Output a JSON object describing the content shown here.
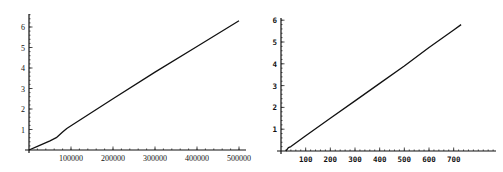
{
  "chart_data": [
    {
      "type": "line",
      "title": "",
      "xlabel": "",
      "ylabel": "",
      "xlim": [
        0,
        520000
      ],
      "ylim": [
        0,
        6.6
      ],
      "grid": false,
      "legend": null,
      "x_ticks": [
        100000,
        200000,
        300000,
        400000,
        500000
      ],
      "x_tick_labels": [
        "100000",
        "200000",
        "300000",
        "400000",
        "500000"
      ],
      "y_ticks": [
        1,
        2,
        3,
        4,
        5,
        6
      ],
      "y_tick_labels": [
        "1",
        "2",
        "3",
        "4",
        "5",
        "6"
      ],
      "series": [
        {
          "name": "",
          "x": [
            0,
            20000,
            50000,
            65000,
            80000,
            90000,
            100000,
            200000,
            300000,
            400000,
            500000
          ],
          "y": [
            0,
            0.18,
            0.45,
            0.6,
            0.88,
            1.05,
            1.18,
            2.5,
            3.8,
            5.05,
            6.3
          ]
        }
      ]
    },
    {
      "type": "line",
      "title": "",
      "xlabel": "",
      "ylabel": "",
      "xlim": [
        0,
        750
      ],
      "ylim": [
        0,
        6.0
      ],
      "grid": false,
      "legend": null,
      "x_ticks": [
        100,
        200,
        300,
        400,
        500,
        600,
        700
      ],
      "x_tick_labels": [
        "100",
        "200",
        "300",
        "400",
        "500",
        "600",
        "700"
      ],
      "y_ticks": [
        1,
        2,
        3,
        4,
        5,
        6
      ],
      "y_tick_labels": [
        "1",
        "2",
        "3",
        "4",
        "5",
        "6"
      ],
      "series": [
        {
          "name": "",
          "x": [
            20,
            30,
            40,
            100,
            200,
            300,
            400,
            500,
            600,
            700,
            730
          ],
          "y": [
            0,
            0.15,
            0.2,
            0.7,
            1.5,
            2.3,
            3.1,
            3.9,
            4.75,
            5.55,
            5.8
          ]
        }
      ]
    }
  ]
}
